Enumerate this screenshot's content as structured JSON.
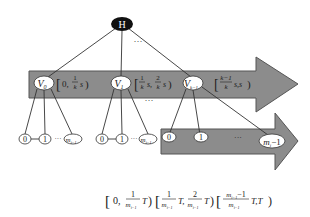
{
  "colors": {
    "arrow_fill": "#8c8c8c",
    "arrow_stroke": "#555555",
    "root_fill": "#111111",
    "node_fill": "#ffffff",
    "line": "#333333",
    "text": "#222222",
    "background": "#ffffff"
  },
  "root": {
    "label": "H"
  },
  "top_ellipsis": "···",
  "mid_ellipsis": "···",
  "level1": {
    "nodes": [
      {
        "label": "V",
        "sub": "0"
      },
      {
        "label": "V",
        "sub": "1"
      },
      {
        "label": "V",
        "sub": "k−1"
      }
    ],
    "intervals": [
      {
        "open": "[",
        "a": "0,",
        "num1": "1",
        "den1": "k",
        "tail1": "s",
        "close": ")"
      },
      {
        "open": "[",
        "num1": "1",
        "den1": "k",
        "tail1": "s,",
        "num2": "2",
        "den2": "k",
        "tail2": "s",
        "close": ")"
      },
      {
        "open": "[",
        "num1": "k−1",
        "den1": "k",
        "tail1": "s,s",
        "close": ")"
      }
    ]
  },
  "level2": {
    "left_group": [
      {
        "label": "0"
      },
      {
        "label": "1"
      },
      {
        "label": "m",
        "sub": "i−1"
      }
    ],
    "middle_group": [
      {
        "label": "0"
      },
      {
        "label": "1"
      },
      {
        "label": "m",
        "sub": "i−1"
      }
    ],
    "right_group": [
      {
        "label": "0"
      },
      {
        "label": "1"
      },
      {
        "label": "m",
        "sub": "i",
        "suffix": "−1"
      }
    ],
    "dots": "···"
  },
  "bottom_formula": {
    "part1": {
      "open": "[",
      "a": "0,",
      "num": "1",
      "den": "m",
      "den_sub": "i−1",
      "tail": "T",
      "close": ")"
    },
    "part2": {
      "open": "[",
      "num1": "1",
      "den1": "m",
      "den1_sub": "i−1",
      "tail1": "T,",
      "num2": "2",
      "den2": "m",
      "den2_sub": "i−1",
      "tail2": "T",
      "close": ")"
    },
    "part3": {
      "open": "[",
      "num": "m",
      "num_sub": "i−1",
      "num_suffix": "−1",
      "den": "m",
      "den_sub": "i−1",
      "tail": "T,T",
      "close": ")"
    }
  }
}
